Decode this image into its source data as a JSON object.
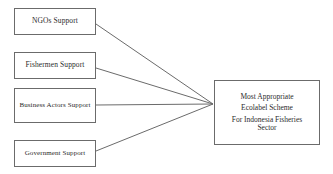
{
  "diagram": {
    "type": "convergence-flow-diagram",
    "line_color": "#6b6b6b",
    "box_border_color": "#6b6b6b",
    "background_color": "#ffffff",
    "text_color": "#2b2b2b",
    "sources": [
      {
        "id": "ngos",
        "label": "NGOs Support"
      },
      {
        "id": "fishermen",
        "label": "Fishermen Support"
      },
      {
        "id": "business",
        "label": "Business Actors Support"
      },
      {
        "id": "government",
        "label": "Government Support"
      }
    ],
    "target": {
      "id": "most-appropriate-ecolabel-scheme",
      "line1": "Most Appropriate",
      "line2": "Ecolabel Scheme",
      "line3": "For Indonesia Fisheries",
      "line4": "Sector"
    }
  }
}
